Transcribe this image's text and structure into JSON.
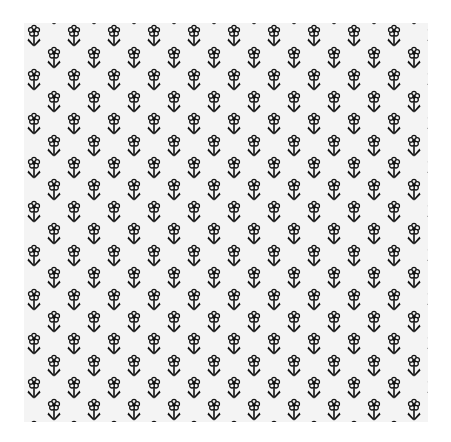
{
  "image": {
    "subject": "black and white floral pattern fabric",
    "background_color": "#ffffff",
    "fabric_color": "#f4f4f4",
    "ink_color": "#111111",
    "motif": "small flower with outlined petals, dark center, stem and V-shaped leaves",
    "layout": "staggered columns"
  }
}
